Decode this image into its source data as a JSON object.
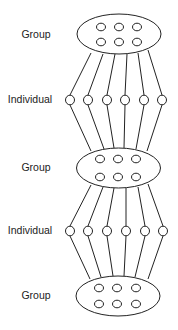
{
  "diagram": {
    "colors": {
      "stroke": "#222222",
      "background": "#ffffff",
      "text": "#222222"
    },
    "levels": [
      {
        "id": "group-top",
        "type": "group",
        "label": "Group",
        "label_x": 36,
        "label_y": 35,
        "ellipse": {
          "cx": 119,
          "cy": 34,
          "rx": 42,
          "ry": 20
        },
        "members": [
          [
            101,
            27
          ],
          [
            119,
            27
          ],
          [
            137,
            27
          ],
          [
            101,
            42
          ],
          [
            119,
            42
          ],
          [
            137,
            42
          ]
        ]
      },
      {
        "id": "individual-1",
        "type": "individual",
        "label": "Individual",
        "label_x": 30,
        "label_y": 100,
        "nodes": [
          [
            70,
            100
          ],
          [
            88,
            100
          ],
          [
            107,
            100
          ],
          [
            125,
            100
          ],
          [
            144,
            100
          ],
          [
            162,
            100
          ]
        ]
      },
      {
        "id": "group-middle",
        "type": "group",
        "label": "Group",
        "label_x": 36,
        "label_y": 168,
        "ellipse": {
          "cx": 118.5,
          "cy": 168,
          "rx": 42,
          "ry": 20
        },
        "members": [
          [
            100,
            159
          ],
          [
            118,
            159
          ],
          [
            136,
            159
          ],
          [
            100,
            177
          ],
          [
            118,
            177
          ],
          [
            136,
            177
          ]
        ]
      },
      {
        "id": "individual-2",
        "type": "individual",
        "label": "Individual",
        "label_x": 30,
        "label_y": 231,
        "nodes": [
          [
            70,
            231
          ],
          [
            88,
            231
          ],
          [
            107,
            231
          ],
          [
            126,
            231
          ],
          [
            145,
            231
          ],
          [
            163,
            231
          ]
        ]
      },
      {
        "id": "group-bottom",
        "type": "group",
        "label": "Group",
        "label_x": 36,
        "label_y": 296,
        "ellipse": {
          "cx": 118,
          "cy": 296,
          "rx": 42,
          "ry": 20
        },
        "members": [
          [
            99,
            288
          ],
          [
            117,
            288
          ],
          [
            136,
            288
          ],
          [
            99,
            304
          ],
          [
            117,
            304
          ],
          [
            136,
            304
          ]
        ]
      }
    ],
    "edges": [
      {
        "from": "group-top",
        "to": "individual-1",
        "segments": [
          [
            91,
            53,
            70,
            95
          ],
          [
            103,
            54,
            88,
            95
          ],
          [
            115,
            54,
            107,
            95
          ],
          [
            127,
            54,
            125,
            95
          ],
          [
            138,
            53,
            144,
            95
          ],
          [
            148,
            50,
            162,
            95
          ]
        ]
      },
      {
        "from": "individual-1",
        "to": "group-middle",
        "segments": [
          [
            70,
            105,
            91,
            151
          ],
          [
            88,
            105,
            104,
            149
          ],
          [
            107,
            105,
            114,
            148
          ],
          [
            125,
            105,
            124,
            148
          ],
          [
            144,
            105,
            136,
            149
          ],
          [
            162,
            105,
            147,
            151
          ]
        ]
      },
      {
        "from": "group-middle",
        "to": "individual-2",
        "segments": [
          [
            91,
            185,
            70,
            226
          ],
          [
            103,
            187,
            88,
            226
          ],
          [
            114,
            188,
            107,
            226
          ],
          [
            126,
            188,
            126,
            226
          ],
          [
            138,
            187,
            145,
            226
          ],
          [
            148,
            184,
            163,
            226
          ]
        ]
      },
      {
        "from": "individual-2",
        "to": "group-bottom",
        "segments": [
          [
            70,
            236,
            90,
            279
          ],
          [
            88,
            236,
            101,
            277
          ],
          [
            107,
            236,
            113,
            276
          ],
          [
            126,
            236,
            124,
            276
          ],
          [
            145,
            236,
            135,
            277
          ],
          [
            163,
            236,
            148,
            279
          ]
        ]
      }
    ]
  }
}
